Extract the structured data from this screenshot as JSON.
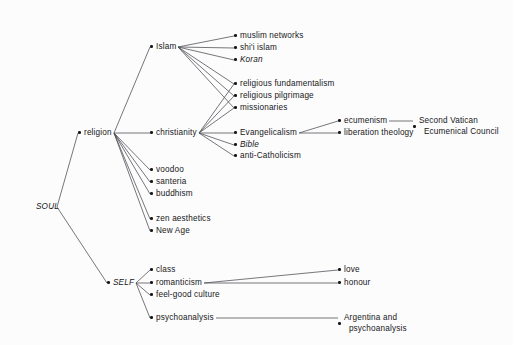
{
  "diagram": {
    "background": "#fcfcfc",
    "line_color": "#4a4a52",
    "text_color": "#17171a",
    "nodes": [
      {
        "id": "soul",
        "label": "SOUL",
        "x": 30,
        "y": 207,
        "style": "italic-nodot",
        "anchor_x": 57,
        "anchor_y": 207
      },
      {
        "id": "religion",
        "label": "religion",
        "x": 78,
        "y": 133,
        "style": "plain"
      },
      {
        "id": "self",
        "label": "SELF",
        "x": 107,
        "y": 283,
        "style": "italic"
      },
      {
        "id": "islam",
        "label": "Islam",
        "x": 150,
        "y": 47,
        "style": "plain"
      },
      {
        "id": "christianity",
        "label": "christianity",
        "x": 150,
        "y": 133,
        "style": "plain"
      },
      {
        "id": "voodoo",
        "label": "voodoo",
        "x": 150,
        "y": 170,
        "style": "plain"
      },
      {
        "id": "santeria",
        "label": "santeria",
        "x": 150,
        "y": 182,
        "style": "plain"
      },
      {
        "id": "buddhism",
        "label": "buddhism",
        "x": 150,
        "y": 194,
        "style": "plain"
      },
      {
        "id": "zen",
        "label": "zen aesthetics",
        "x": 150,
        "y": 219,
        "style": "plain"
      },
      {
        "id": "newage",
        "label": "New Age",
        "x": 150,
        "y": 231,
        "style": "plain"
      },
      {
        "id": "class",
        "label": "class",
        "x": 150,
        "y": 270,
        "style": "plain"
      },
      {
        "id": "romanticism",
        "label": "romanticism",
        "x": 150,
        "y": 283,
        "style": "plain"
      },
      {
        "id": "feelgood",
        "label": "feel-good culture",
        "x": 150,
        "y": 295,
        "style": "plain"
      },
      {
        "id": "psychoanalysis",
        "label": "psychoanalysis",
        "x": 150,
        "y": 318,
        "style": "plain"
      },
      {
        "id": "muslimnetworks",
        "label": "muslim networks",
        "x": 234,
        "y": 36,
        "style": "plain"
      },
      {
        "id": "shiiislam",
        "label": "shi'i islam",
        "x": 234,
        "y": 48,
        "style": "plain"
      },
      {
        "id": "koran",
        "label": "Koran",
        "x": 234,
        "y": 60,
        "style": "italic"
      },
      {
        "id": "fundamentalism",
        "label": "religious fundamentalism",
        "x": 234,
        "y": 84,
        "style": "plain"
      },
      {
        "id": "pilgrimage",
        "label": "religious pilgrimage",
        "x": 234,
        "y": 96,
        "style": "plain"
      },
      {
        "id": "missionaries",
        "label": "missionaries",
        "x": 234,
        "y": 108,
        "style": "plain"
      },
      {
        "id": "evangelicalism",
        "label": "Evangelicalism",
        "x": 234,
        "y": 133,
        "style": "plain"
      },
      {
        "id": "bible",
        "label": "Bible",
        "x": 234,
        "y": 145,
        "style": "italic"
      },
      {
        "id": "anticatholicism",
        "label": "anti-Catholicism",
        "x": 234,
        "y": 156,
        "style": "plain"
      },
      {
        "id": "ecumenism",
        "label": "ecumenism",
        "x": 338,
        "y": 121,
        "style": "plain"
      },
      {
        "id": "liberation",
        "label": "liberation theology",
        "x": 338,
        "y": 133,
        "style": "plain"
      },
      {
        "id": "vatican",
        "label": "Second Vatican\n  Ecumenical Council",
        "x": 413,
        "y": 121,
        "style": "two-line"
      },
      {
        "id": "love",
        "label": "love",
        "x": 338,
        "y": 270,
        "style": "plain"
      },
      {
        "id": "honour",
        "label": "honour",
        "x": 338,
        "y": 283,
        "style": "plain"
      },
      {
        "id": "argentina",
        "label": "Argentina and\n  psychoanalysis",
        "x": 338,
        "y": 318,
        "style": "two-line"
      }
    ],
    "edges": [
      {
        "from": "soul",
        "to": "religion"
      },
      {
        "from": "soul",
        "to": "self"
      },
      {
        "from": "religion",
        "to": "islam"
      },
      {
        "from": "religion",
        "to": "christianity"
      },
      {
        "from": "religion",
        "to": "voodoo"
      },
      {
        "from": "religion",
        "to": "santeria"
      },
      {
        "from": "religion",
        "to": "buddhism"
      },
      {
        "from": "religion",
        "to": "zen"
      },
      {
        "from": "religion",
        "to": "newage"
      },
      {
        "from": "islam",
        "to": "muslimnetworks"
      },
      {
        "from": "islam",
        "to": "shiiislam"
      },
      {
        "from": "islam",
        "to": "koran"
      },
      {
        "from": "islam",
        "to": "fundamentalism"
      },
      {
        "from": "islam",
        "to": "pilgrimage"
      },
      {
        "from": "islam",
        "to": "missionaries"
      },
      {
        "from": "christianity",
        "to": "fundamentalism"
      },
      {
        "from": "christianity",
        "to": "pilgrimage"
      },
      {
        "from": "christianity",
        "to": "missionaries"
      },
      {
        "from": "christianity",
        "to": "evangelicalism"
      },
      {
        "from": "christianity",
        "to": "bible"
      },
      {
        "from": "christianity",
        "to": "anticatholicism"
      },
      {
        "from": "evangelicalism",
        "to": "ecumenism"
      },
      {
        "from": "evangelicalism",
        "to": "liberation"
      },
      {
        "from": "ecumenism",
        "to": "vatican"
      },
      {
        "from": "self",
        "to": "class"
      },
      {
        "from": "self",
        "to": "romanticism"
      },
      {
        "from": "self",
        "to": "feelgood"
      },
      {
        "from": "self",
        "to": "psychoanalysis"
      },
      {
        "from": "romanticism",
        "to": "love"
      },
      {
        "from": "romanticism",
        "to": "honour"
      },
      {
        "from": "psychoanalysis",
        "to": "argentina"
      }
    ]
  }
}
